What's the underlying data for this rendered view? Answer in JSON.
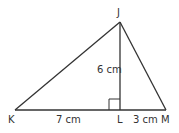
{
  "diagram": {
    "type": "triangle",
    "points": {
      "J": {
        "label": "J",
        "x": 120,
        "y": 22
      },
      "K": {
        "label": "K",
        "x": 15,
        "y": 110
      },
      "L": {
        "label": "L",
        "x": 120,
        "y": 110
      },
      "M": {
        "label": "M",
        "x": 166,
        "y": 110
      }
    },
    "measurements": {
      "JL": "6 cm",
      "KL": "7 cm",
      "LM": "3 cm"
    },
    "right_angle_at": "L",
    "stroke_color": "#333333"
  }
}
